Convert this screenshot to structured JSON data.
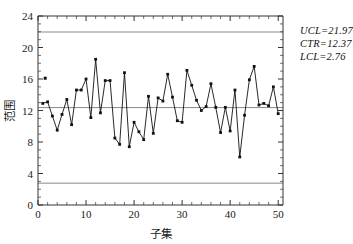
{
  "chart_data": {
    "type": "line",
    "title": "",
    "xlabel": "子集",
    "ylabel": "范围",
    "xlim": [
      0,
      51
    ],
    "ylim": [
      0,
      24
    ],
    "xticks": [
      0,
      10,
      20,
      30,
      40,
      50
    ],
    "yticks": [
      0,
      4,
      8,
      12,
      16,
      20,
      24
    ],
    "grid": false,
    "legend": "none",
    "x": [
      1,
      2,
      3,
      4,
      5,
      6,
      7,
      8,
      9,
      10,
      11,
      12,
      13,
      14,
      15,
      16,
      17,
      18,
      19,
      20,
      21,
      22,
      23,
      24,
      25,
      26,
      27,
      28,
      29,
      30,
      31,
      32,
      33,
      34,
      35,
      36,
      37,
      38,
      39,
      40,
      41,
      42,
      43,
      44,
      45,
      46,
      47,
      48,
      49,
      50
    ],
    "values": [
      12.9,
      13.1,
      11.3,
      9.5,
      11.5,
      13.4,
      10.2,
      14.6,
      14.6,
      16.0,
      11.1,
      18.5,
      11.7,
      15.8,
      15.8,
      8.5,
      7.7,
      16.8,
      7.4,
      10.5,
      9.3,
      8.3,
      13.8,
      9.1,
      13.6,
      13.2,
      16.6,
      13.7,
      10.7,
      10.5,
      17.1,
      15.2,
      13.3,
      12.0,
      12.5,
      15.4,
      12.4,
      9.2,
      12.4,
      9.4,
      14.6,
      6.1,
      11.4,
      15.9,
      17.6,
      12.7,
      12.9,
      12.6,
      15.0,
      11.6
    ],
    "outlier_points": [
      {
        "x": 1.5,
        "y": 16.1
      }
    ],
    "series_name": "范围",
    "marker": "square",
    "control_limits": {
      "ucl": {
        "label": "UCL",
        "value": 21.97,
        "text": "UCL=21.97"
      },
      "ctr": {
        "label": "CTR",
        "value": 12.37,
        "text": "CTR=12.37"
      },
      "lcl": {
        "label": "LCL",
        "value": 2.76,
        "text": "LCL=2.76"
      }
    },
    "colors": {
      "line": "#111111",
      "marker": "#111111",
      "limit_line": "#b0b0b0",
      "center_line": "#555555",
      "axis": "#333333",
      "background": "#ffffff"
    }
  },
  "axis": {
    "y_tick_labels": [
      "0",
      "4",
      "8",
      "12",
      "16",
      "20",
      "24"
    ],
    "x_tick_labels": [
      "0",
      "10",
      "20",
      "30",
      "40",
      "50"
    ],
    "y_title": "范围",
    "x_title": "子集"
  },
  "annotations": {
    "ucl_text": "UCL=21.97",
    "ctr_text": "CTR=12.37",
    "lcl_text": "LCL=2.76"
  }
}
